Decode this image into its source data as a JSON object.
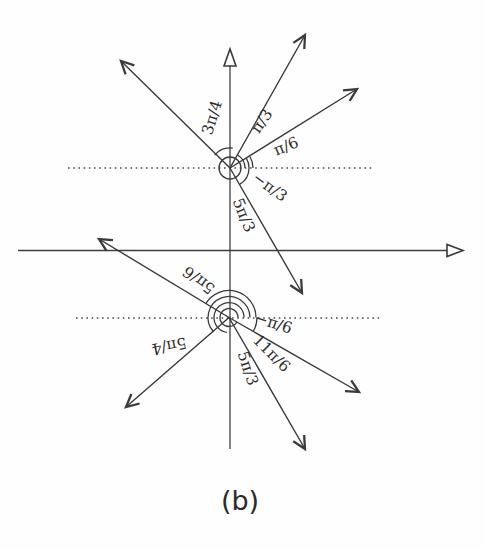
{
  "figure": {
    "caption": "(b)",
    "ink_color": "#3a3a3a",
    "background_color": "#fefefe",
    "upper_vertex": {
      "angle_labels": {
        "three_pi_over_4": "3π/4",
        "pi_over_3": "π/3",
        "pi_over_6": "π/6",
        "neg_pi_over_3": "−π/3",
        "five_pi_over_3": "5π/3"
      }
    },
    "lower_vertex": {
      "angle_labels": {
        "five_pi_over_6": "5π/6",
        "five_pi_over_4": "5π/4",
        "neg_pi_over_6": "−π/6",
        "eleven_pi_over_6": "11π/6",
        "five_pi_over_3": "5π/3"
      }
    }
  }
}
